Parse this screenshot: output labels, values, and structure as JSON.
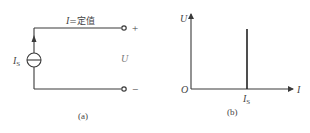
{
  "figure_a": {
    "current_label_var": "I",
    "current_label_rest": "=定值",
    "source_label": "I",
    "source_label_sub": "S",
    "voltage_label": "U",
    "plus": "+",
    "minus": "−",
    "caption": "(a)"
  },
  "figure_b": {
    "y_axis_label": "U",
    "x_axis_label": "I",
    "origin_label": "O",
    "tick_label": "I",
    "tick_label_sub": "S",
    "caption": "(b)"
  },
  "colors": {
    "line": "#3a3a3a",
    "text": "#444444",
    "background": "#ffffff"
  }
}
